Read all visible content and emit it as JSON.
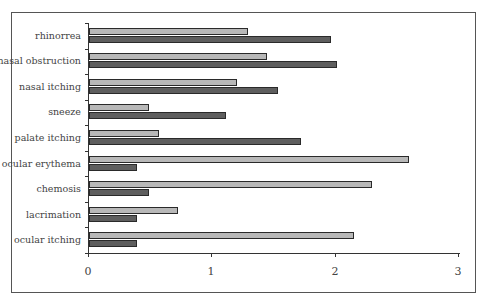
{
  "chart_data": {
    "type": "bar",
    "orientation": "horizontal",
    "title": "",
    "xlabel": "",
    "ylabel": "",
    "categories": [
      "rhinorrea",
      "nasal obstruction",
      "nasal itching",
      "sneeze",
      "palate itching",
      "ocular erythema",
      "chemosis",
      "lacrimation",
      "ocular itching"
    ],
    "series": [
      {
        "name": "series-light",
        "color": "#b8b8b8",
        "values": [
          1.29,
          1.44,
          1.2,
          0.49,
          0.57,
          2.59,
          2.29,
          0.72,
          2.15
        ]
      },
      {
        "name": "series-dark",
        "color": "#5e5e5e",
        "values": [
          1.96,
          2.01,
          1.53,
          1.11,
          1.72,
          0.39,
          0.49,
          0.39,
          0.39
        ]
      }
    ],
    "xlim": [
      0,
      3
    ],
    "xticks": [
      "0",
      "1",
      "2",
      "3"
    ],
    "grid": false,
    "legend": "none"
  }
}
